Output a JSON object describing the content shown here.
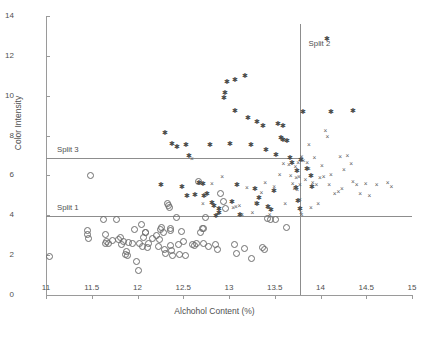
{
  "chart_data": {
    "type": "scatter",
    "title": "",
    "xlabel": "Alchohol Content (%)",
    "ylabel": "Color Intensity",
    "xlim": [
      11,
      15
    ],
    "ylim": [
      0,
      14
    ],
    "xticks": [
      "11",
      "11.5",
      "12",
      "12.5",
      "13",
      "13.5",
      "14",
      "14.5",
      "15"
    ],
    "xtick_values": [
      11,
      11.5,
      12,
      12.5,
      13,
      13.5,
      14,
      14.5,
      15
    ],
    "yticks": [
      "0",
      "2",
      "4",
      "6",
      "8",
      "10",
      "12",
      "14"
    ],
    "ytick_values": [
      0,
      2,
      4,
      6,
      8,
      10,
      12,
      14
    ],
    "grid": false,
    "legend": "none",
    "annotations": [
      {
        "label": "Split 1",
        "kind": "horizontal-line",
        "value": 3.95,
        "x_start": 11.0,
        "x_end": 15.0,
        "label_x": 11.12,
        "label_y": 4.35
      },
      {
        "label": "Split 2",
        "kind": "vertical-line",
        "value": 13.78,
        "y_start": 0.0,
        "y_end": 13.6,
        "label_x": 13.87,
        "label_y": 12.6
      },
      {
        "label": "Split 3",
        "kind": "horizontal-line",
        "value": 6.88,
        "x_start": 11.0,
        "x_end": 13.78,
        "label_x": 11.12,
        "label_y": 7.3
      }
    ],
    "series": [
      {
        "name": "class-circle",
        "marker": "circle-open",
        "color": "#6e6e6e",
        "points": [
          [
            11.03,
            1.95
          ],
          [
            11.45,
            3.05
          ],
          [
            11.45,
            3.25
          ],
          [
            11.46,
            2.85
          ],
          [
            11.48,
            6.0
          ],
          [
            11.62,
            3.8
          ],
          [
            11.64,
            3.05
          ],
          [
            11.65,
            2.6
          ],
          [
            11.66,
            2.7
          ],
          [
            11.68,
            2.6
          ],
          [
            11.72,
            2.75
          ],
          [
            11.76,
            3.8
          ],
          [
            11.79,
            2.8
          ],
          [
            11.81,
            2.9
          ],
          [
            11.82,
            2.55
          ],
          [
            11.84,
            2.7
          ],
          [
            11.86,
            2.05
          ],
          [
            11.87,
            2.2
          ],
          [
            11.88,
            2.0
          ],
          [
            11.9,
            2.65
          ],
          [
            11.94,
            2.6
          ],
          [
            11.96,
            3.3
          ],
          [
            11.98,
            1.7
          ],
          [
            12.0,
            1.25
          ],
          [
            12.02,
            2.6
          ],
          [
            12.04,
            3.55
          ],
          [
            12.05,
            2.45
          ],
          [
            12.06,
            2.9
          ],
          [
            12.08,
            3.15
          ],
          [
            12.1,
            2.4
          ],
          [
            12.12,
            2.6
          ],
          [
            12.16,
            2.85
          ],
          [
            12.2,
            3.0
          ],
          [
            12.22,
            2.45
          ],
          [
            12.24,
            2.8
          ],
          [
            12.25,
            3.3
          ],
          [
            12.26,
            3.4
          ],
          [
            12.28,
            3.15
          ],
          [
            12.29,
            2.3
          ],
          [
            12.3,
            2.1
          ],
          [
            12.32,
            4.6
          ],
          [
            12.33,
            4.5
          ],
          [
            12.34,
            4.4
          ],
          [
            12.36,
            2.5
          ],
          [
            12.37,
            2.25
          ],
          [
            12.38,
            2.0
          ],
          [
            12.42,
            3.9
          ],
          [
            12.44,
            2.55
          ],
          [
            12.45,
            2.05
          ],
          [
            12.47,
            3.2
          ],
          [
            12.5,
            2.7
          ],
          [
            12.52,
            2.0
          ],
          [
            12.6,
            2.55
          ],
          [
            12.62,
            2.5
          ],
          [
            12.64,
            2.6
          ],
          [
            12.66,
            5.7
          ],
          [
            12.68,
            3.15
          ],
          [
            12.7,
            3.35
          ],
          [
            12.72,
            2.6
          ],
          [
            12.74,
            3.9
          ],
          [
            12.77,
            2.45
          ],
          [
            12.85,
            2.55
          ],
          [
            12.87,
            2.3
          ],
          [
            12.9,
            5.1
          ],
          [
            12.93,
            4.7
          ],
          [
            12.96,
            4.35
          ],
          [
            13.05,
            2.55
          ],
          [
            13.08,
            2.1
          ],
          [
            13.16,
            2.35
          ],
          [
            13.24,
            1.85
          ],
          [
            13.36,
            2.4
          ],
          [
            13.38,
            2.3
          ],
          [
            13.41,
            3.85
          ],
          [
            13.45,
            3.8
          ],
          [
            13.5,
            3.8
          ],
          [
            13.62,
            3.4
          ],
          [
            12.08,
            3.15
          ],
          [
            12.35,
            3.25
          ],
          [
            12.36,
            3.35
          ],
          [
            12.72,
            3.35
          ]
        ]
      },
      {
        "name": "class-star",
        "marker": "asterisk",
        "color": "#4a4a4a",
        "points": [
          [
            12.25,
            5.5
          ],
          [
            12.29,
            8.15
          ],
          [
            12.37,
            7.6
          ],
          [
            12.42,
            7.45
          ],
          [
            12.47,
            5.4
          ],
          [
            12.52,
            7.55
          ],
          [
            12.53,
            4.95
          ],
          [
            12.55,
            7.0
          ],
          [
            12.62,
            5.0
          ],
          [
            12.66,
            5.6
          ],
          [
            12.7,
            5.55
          ],
          [
            12.72,
            4.95
          ],
          [
            12.75,
            5.05
          ],
          [
            12.78,
            7.55
          ],
          [
            12.8,
            4.6
          ],
          [
            12.82,
            4.45
          ],
          [
            12.85,
            3.95
          ],
          [
            12.88,
            4.1
          ],
          [
            12.93,
            9.9
          ],
          [
            12.94,
            10.15
          ],
          [
            12.97,
            10.7
          ],
          [
            13.0,
            7.6
          ],
          [
            13.02,
            4.65
          ],
          [
            13.05,
            9.25
          ],
          [
            13.08,
            5.5
          ],
          [
            13.11,
            4.0
          ],
          [
            13.16,
            11.0
          ],
          [
            13.2,
            8.9
          ],
          [
            13.23,
            7.55
          ],
          [
            13.27,
            5.3
          ],
          [
            13.3,
            4.55
          ],
          [
            13.32,
            4.85
          ],
          [
            13.36,
            8.5
          ],
          [
            13.39,
            7.3
          ],
          [
            13.42,
            4.4
          ],
          [
            13.45,
            4.25
          ],
          [
            13.48,
            5.2
          ],
          [
            13.5,
            7.05
          ],
          [
            13.52,
            8.6
          ],
          [
            13.56,
            7.9
          ],
          [
            13.58,
            7.8
          ],
          [
            13.62,
            7.75
          ],
          [
            13.66,
            6.85
          ],
          [
            13.68,
            6.6
          ],
          [
            13.72,
            5.35
          ],
          [
            13.73,
            6.2
          ],
          [
            13.74,
            4.7
          ],
          [
            13.76,
            4.3
          ],
          [
            13.78,
            6.75
          ],
          [
            13.8,
            9.2
          ],
          [
            13.84,
            6.3
          ],
          [
            13.88,
            5.95
          ],
          [
            13.9,
            5.4
          ],
          [
            14.06,
            12.85
          ],
          [
            14.1,
            9.2
          ],
          [
            14.34,
            9.25
          ],
          [
            13.05,
            10.8
          ],
          [
            12.88,
            4.3
          ],
          [
            13.3,
            8.7
          ],
          [
            13.58,
            8.5
          ]
        ]
      },
      {
        "name": "class-cross",
        "marker": "x",
        "color": "#5a5a5a",
        "points": [
          [
            12.6,
            6.8
          ],
          [
            12.82,
            5.55
          ],
          [
            12.93,
            5.9
          ],
          [
            13.05,
            4.35
          ],
          [
            13.08,
            4.4
          ],
          [
            13.12,
            4.45
          ],
          [
            13.2,
            5.35
          ],
          [
            13.26,
            4.1
          ],
          [
            13.3,
            4.6
          ],
          [
            13.36,
            5.1
          ],
          [
            13.4,
            5.6
          ],
          [
            13.45,
            4.0
          ],
          [
            13.5,
            5.4
          ],
          [
            13.56,
            6.0
          ],
          [
            13.6,
            6.55
          ],
          [
            13.62,
            4.55
          ],
          [
            13.66,
            6.5
          ],
          [
            13.68,
            5.95
          ],
          [
            13.7,
            5.55
          ],
          [
            13.72,
            5.3
          ],
          [
            13.73,
            6.4
          ],
          [
            13.74,
            5.85
          ],
          [
            13.75,
            5.25
          ],
          [
            13.76,
            6.6
          ],
          [
            13.77,
            5.9
          ],
          [
            13.78,
            5.5
          ],
          [
            13.79,
            4.1
          ],
          [
            13.8,
            6.9
          ],
          [
            13.82,
            6.7
          ],
          [
            13.84,
            5.75
          ],
          [
            13.86,
            6.6
          ],
          [
            13.88,
            6.3
          ],
          [
            13.9,
            4.35
          ],
          [
            13.92,
            5.6
          ],
          [
            13.94,
            6.85
          ],
          [
            13.96,
            5.5
          ],
          [
            13.98,
            4.55
          ],
          [
            14.0,
            5.85
          ],
          [
            14.02,
            6.45
          ],
          [
            14.04,
            5.9
          ],
          [
            14.06,
            8.25
          ],
          [
            14.08,
            7.95
          ],
          [
            14.1,
            5.5
          ],
          [
            14.12,
            6.0
          ],
          [
            14.16,
            5.05
          ],
          [
            14.2,
            5.15
          ],
          [
            14.22,
            6.9
          ],
          [
            14.24,
            5.3
          ],
          [
            14.26,
            6.25
          ],
          [
            14.3,
            7.0
          ],
          [
            14.34,
            6.55
          ],
          [
            14.36,
            5.65
          ],
          [
            14.4,
            5.5
          ],
          [
            14.44,
            5.05
          ],
          [
            14.5,
            5.55
          ],
          [
            14.54,
            4.95
          ],
          [
            14.62,
            5.5
          ],
          [
            14.74,
            5.6
          ],
          [
            14.78,
            5.4
          ],
          [
            13.43,
            4.35
          ],
          [
            13.78,
            4.75
          ],
          [
            13.8,
            4.0
          ],
          [
            12.72,
            4.55
          ],
          [
            13.15,
            4.0
          ],
          [
            13.88,
            7.55
          ]
        ]
      }
    ]
  }
}
